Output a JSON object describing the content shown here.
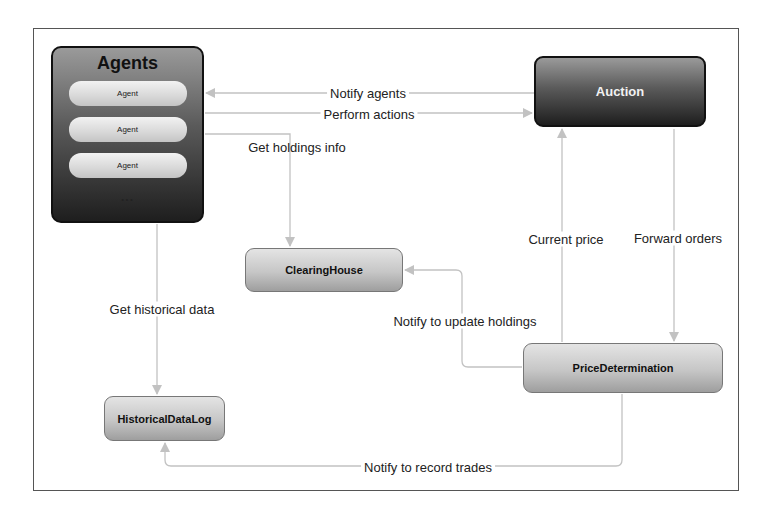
{
  "diagram": {
    "nodes": {
      "agents": {
        "title": "Agents",
        "items": [
          "Agent",
          "Agent",
          "Agent"
        ],
        "more": "..."
      },
      "auction": {
        "label": "Auction"
      },
      "clearing_house": {
        "label": "ClearingHouse"
      },
      "price_determination": {
        "label": "PriceDetermination"
      },
      "historical_data_log": {
        "label": "HistoricalDataLog"
      }
    },
    "edges": {
      "notify_agents": {
        "label": "Notify agents",
        "from": "Auction",
        "to": "Agents"
      },
      "perform_actions": {
        "label": "Perform actions",
        "from": "Agents",
        "to": "Auction"
      },
      "get_holdings_info": {
        "label": "Get holdings info",
        "from": "Agents",
        "to": "ClearingHouse"
      },
      "get_historical_data": {
        "label": "Get historical data",
        "from": "Agents",
        "to": "HistoricalDataLog"
      },
      "current_price": {
        "label": "Current price",
        "from": "PriceDetermination",
        "to": "Auction"
      },
      "forward_orders": {
        "label": "Forward orders",
        "from": "Auction",
        "to": "PriceDetermination"
      },
      "notify_update_holdings": {
        "label": "Notify to update holdings",
        "from": "PriceDetermination",
        "to": "ClearingHouse"
      },
      "notify_record_trades": {
        "label": "Notify to record trades",
        "from": "PriceDetermination",
        "to": "HistoricalDataLog"
      }
    },
    "colors": {
      "frame": "#555555",
      "edge": "#bdbdbd",
      "dark_node": "#1e1e1e",
      "light_node": "#c6c6c6"
    }
  }
}
